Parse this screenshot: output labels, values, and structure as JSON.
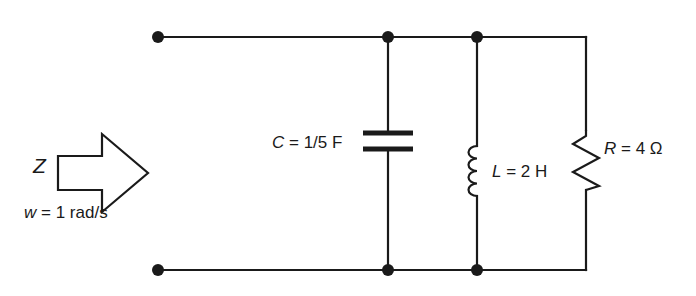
{
  "figure": {
    "name": "ac-impedance-parallel-rlc-circuit",
    "stroke_color": "#1a1a1a",
    "background_color": "#ffffff"
  },
  "source": {
    "impedance_label": "Z",
    "frequency_label": "w = 1 rad/s",
    "frequency_symbol": "w",
    "frequency_value": "= 1 rad/s",
    "arrow_direction": "right"
  },
  "components": [
    {
      "id": "capacitor",
      "symbol": "C",
      "label": "C = 1/5 F",
      "value_text": "= 1/5 F",
      "value": "1/5",
      "unit": "F",
      "type": "capacitor"
    },
    {
      "id": "inductor",
      "symbol": "L",
      "label": "L = 2 H",
      "value_text": "= 2 H",
      "value": "2",
      "unit": "H",
      "type": "inductor"
    },
    {
      "id": "resistor",
      "symbol": "R",
      "label": "R = 4 Ω",
      "value_text": "= 4 Ω",
      "value": "4",
      "unit": "Ω",
      "type": "resistor"
    }
  ],
  "nodes": {
    "terminal_top_left": {
      "x": 158,
      "y": 37
    },
    "terminal_bottom_left": {
      "x": 158,
      "y": 270
    },
    "capacitor_top": {
      "x": 388,
      "y": 37
    },
    "capacitor_bottom": {
      "x": 388,
      "y": 270
    },
    "inductor_top": {
      "x": 477,
      "y": 37
    },
    "inductor_bottom": {
      "x": 477,
      "y": 270
    },
    "resistor_top": {
      "x": 586,
      "y": 37
    },
    "resistor_bottom": {
      "x": 586,
      "y": 270
    }
  }
}
